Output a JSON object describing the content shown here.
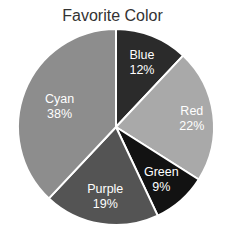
{
  "chart_data": {
    "type": "pie",
    "title": "Favorite Color",
    "categories": [
      "Blue",
      "Red",
      "Green",
      "Purple",
      "Cyan"
    ],
    "values": [
      12,
      22,
      9,
      19,
      38
    ],
    "labels": [
      "12%",
      "22%",
      "9%",
      "19%",
      "38%"
    ],
    "colors": [
      "#2b2b2b",
      "#a9a9a9",
      "#121212",
      "#545454",
      "#8d8d8d"
    ],
    "start_angle": -90,
    "direction": "clockwise",
    "legend": "none"
  }
}
